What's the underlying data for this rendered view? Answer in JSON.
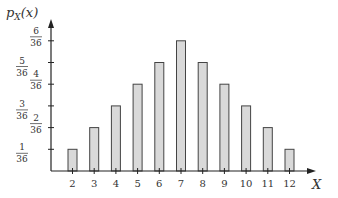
{
  "chart_data": {
    "type": "bar",
    "title": "",
    "xlabel": "X",
    "ylabel": "p_X(x)",
    "ylabel_parts": {
      "p": "p",
      "sub": "X",
      "arg": "(x)"
    },
    "categories": [
      "2",
      "3",
      "4",
      "5",
      "6",
      "7",
      "8",
      "9",
      "10",
      "11",
      "12"
    ],
    "values": [
      0.0278,
      0.0556,
      0.0833,
      0.1111,
      0.1389,
      0.1667,
      0.1389,
      0.1111,
      0.0833,
      0.0556,
      0.0278
    ],
    "values_numerators": [
      1,
      2,
      3,
      4,
      5,
      6,
      5,
      4,
      3,
      2,
      1
    ],
    "denominator": 36,
    "y_ticks": [
      {
        "num": "1",
        "den": "36"
      },
      {
        "num": "2",
        "den": "36"
      },
      {
        "num": "3",
        "den": "36"
      },
      {
        "num": "4",
        "den": "36"
      },
      {
        "num": "5",
        "den": "36"
      },
      {
        "num": "6",
        "den": "36"
      }
    ],
    "ylim": [
      0,
      0.1944
    ],
    "grid": false,
    "legend": null,
    "colors": {
      "bar_fill": "#d9d9d9",
      "bar_stroke": "#444444",
      "axis": "#222222",
      "text": "#333333"
    }
  }
}
